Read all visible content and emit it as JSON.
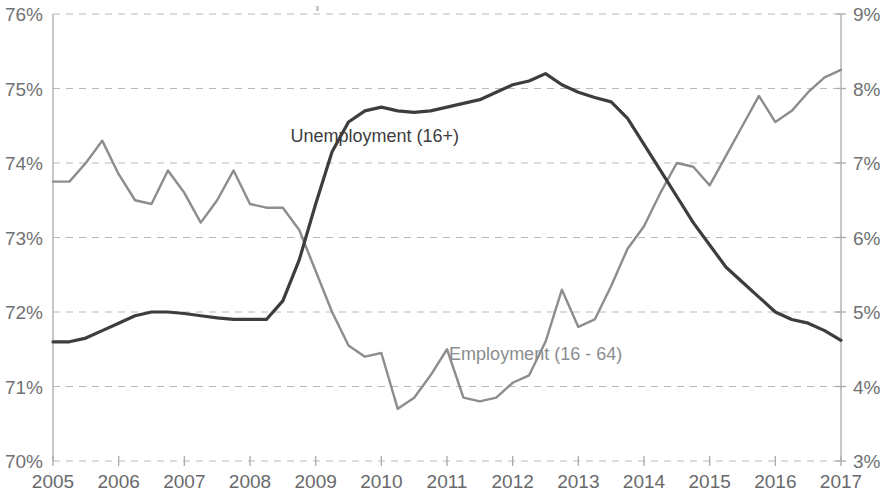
{
  "chart_data": {
    "type": "line",
    "title": "",
    "subtitle": "",
    "xlabel": "",
    "ylabel": "",
    "grid": true,
    "legend_position": "inline-annotation",
    "x_tick_labels": [
      "2005",
      "2006",
      "2007",
      "2008",
      "2009",
      "2010",
      "2011",
      "2012",
      "2013",
      "2014",
      "2015",
      "2016",
      "2017"
    ],
    "x_range": [
      2005,
      2017
    ],
    "left_axis": {
      "tick_labels": [
        "70%",
        "71%",
        "72%",
        "73%",
        "74%",
        "75%",
        "76%"
      ],
      "ticks": [
        70,
        71,
        72,
        73,
        74,
        75,
        76
      ],
      "ylim": [
        70,
        76
      ],
      "series": "Employment (16 - 64)"
    },
    "right_axis": {
      "tick_labels": [
        "3%",
        "4%",
        "5%",
        "6%",
        "7%",
        "8%",
        "9%"
      ],
      "ticks": [
        3,
        4,
        5,
        6,
        7,
        8,
        9
      ],
      "ylim": [
        3,
        9
      ],
      "series": "Unemployment (16+)"
    },
    "series": [
      {
        "name": "Employment (16 - 64)",
        "axis": "left",
        "color": "#8c8d8f",
        "label_text": "Employment (16 - 64)",
        "label_x": 2012.35,
        "label_y": 71.35,
        "x": [
          2005.0,
          2005.25,
          2005.5,
          2005.75,
          2006.0,
          2006.25,
          2006.5,
          2006.75,
          2007.0,
          2007.25,
          2007.5,
          2007.75,
          2008.0,
          2008.25,
          2008.5,
          2008.75,
          2009.0,
          2009.25,
          2009.5,
          2009.75,
          2010.0,
          2010.25,
          2010.5,
          2010.75,
          2011.0,
          2011.25,
          2011.5,
          2011.75,
          2012.0,
          2012.25,
          2012.5,
          2012.75,
          2013.0,
          2013.25,
          2013.5,
          2013.75,
          2014.0,
          2014.25,
          2014.5,
          2014.75,
          2015.0,
          2015.25,
          2015.5,
          2015.75,
          2016.0,
          2016.25,
          2016.5,
          2016.75,
          2017.0
        ],
        "y": [
          73.75,
          73.75,
          74.0,
          74.3,
          73.85,
          73.5,
          73.45,
          73.9,
          73.6,
          73.2,
          73.5,
          73.9,
          73.45,
          73.4,
          73.4,
          73.1,
          72.55,
          72.0,
          71.55,
          71.4,
          71.45,
          70.7,
          70.85,
          71.15,
          71.5,
          70.85,
          70.8,
          70.85,
          71.05,
          71.15,
          71.6,
          72.3,
          71.8,
          71.9,
          72.35,
          72.85,
          73.15,
          73.6,
          74.0,
          73.95,
          73.7,
          74.1,
          74.5,
          74.9,
          74.55,
          74.7,
          74.95,
          75.15,
          75.25
        ],
        "key_points": {
          "start_2005": 73.75,
          "peak_2005_q4": 74.3,
          "trough_2010_q2": 70.7,
          "end_2017": 75.25
        }
      },
      {
        "name": "Unemployment (16+)",
        "axis": "right",
        "color": "#3d3d3f",
        "label_text": "Unemployment (16+)",
        "label_x": 2009.9,
        "label_y": 7.28,
        "x": [
          2005.0,
          2005.25,
          2005.5,
          2005.75,
          2006.0,
          2006.25,
          2006.5,
          2006.75,
          2007.0,
          2007.25,
          2007.5,
          2007.75,
          2008.0,
          2008.25,
          2008.5,
          2008.75,
          2009.0,
          2009.25,
          2009.5,
          2009.75,
          2010.0,
          2010.25,
          2010.5,
          2010.75,
          2011.0,
          2011.25,
          2011.5,
          2011.75,
          2012.0,
          2012.25,
          2012.5,
          2012.75,
          2013.0,
          2013.25,
          2013.5,
          2013.75,
          2014.0,
          2014.25,
          2014.5,
          2014.75,
          2015.0,
          2015.25,
          2015.5,
          2015.75,
          2016.0,
          2016.25,
          2016.5,
          2016.75,
          2017.0
        ],
        "y": [
          4.6,
          4.6,
          4.65,
          4.75,
          4.85,
          4.95,
          5.0,
          5.0,
          4.98,
          4.95,
          4.92,
          4.9,
          4.9,
          4.9,
          5.15,
          5.7,
          6.45,
          7.15,
          7.55,
          7.7,
          7.75,
          7.7,
          7.68,
          7.7,
          7.75,
          7.8,
          7.85,
          7.95,
          8.05,
          8.1,
          8.2,
          8.05,
          7.95,
          7.88,
          7.82,
          7.6,
          7.25,
          6.9,
          6.55,
          6.2,
          5.9,
          5.6,
          5.4,
          5.2,
          5.0,
          4.9,
          4.85,
          4.75,
          4.62
        ],
        "key_points": {
          "start_2005": 4.6,
          "peak_2012_q3": 8.2,
          "end_2017": 4.62
        }
      }
    ]
  },
  "annotations": {
    "unemployment_label": "Unemployment (16+)",
    "employment_label": "Employment (16 - 64)"
  },
  "colors": {
    "unemployment_line": "#3d3d3f",
    "employment_line": "#8c8d8f",
    "gridline": "#b9b9bb",
    "axis_line": "#a9aaac",
    "tick_label": "#6f7173",
    "background": "#ffffff"
  }
}
